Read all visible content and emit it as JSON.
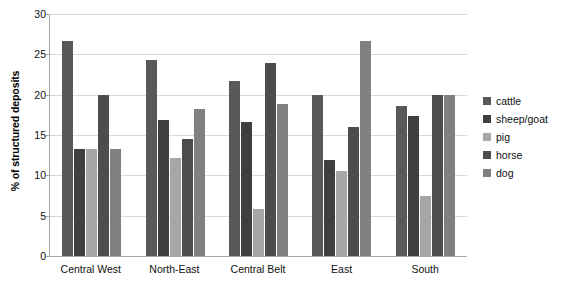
{
  "chart_data": {
    "type": "bar",
    "title": "",
    "xlabel": "",
    "ylabel": "% of structured deposits",
    "ylim": [
      0,
      30
    ],
    "yticks": [
      0,
      5,
      10,
      15,
      20,
      25,
      30
    ],
    "grid": true,
    "legend_position": "right",
    "categories": [
      "Central West",
      "North-East",
      "Central Belt",
      "East",
      "South"
    ],
    "series": [
      {
        "name": "cattle",
        "color": "#595959",
        "values": [
          26.7,
          24.3,
          21.7,
          20.0,
          18.6
        ]
      },
      {
        "name": "sheep/goat",
        "color": "#3f3f3f",
        "values": [
          13.3,
          16.9,
          16.6,
          11.9,
          17.3
        ]
      },
      {
        "name": "pig",
        "color": "#a6a6a6",
        "values": [
          13.3,
          12.2,
          5.8,
          10.6,
          7.4
        ]
      },
      {
        "name": "horse",
        "color": "#4d4d4d",
        "values": [
          20.0,
          14.5,
          23.9,
          16.0,
          20.0
        ]
      },
      {
        "name": "dog",
        "color": "#808080",
        "values": [
          13.3,
          18.2,
          18.8,
          26.7,
          20.0
        ]
      }
    ]
  },
  "legend": {
    "items": [
      {
        "label": "cattle"
      },
      {
        "label": "sheep/goat"
      },
      {
        "label": "pig"
      },
      {
        "label": "horse"
      },
      {
        "label": "dog"
      }
    ]
  }
}
